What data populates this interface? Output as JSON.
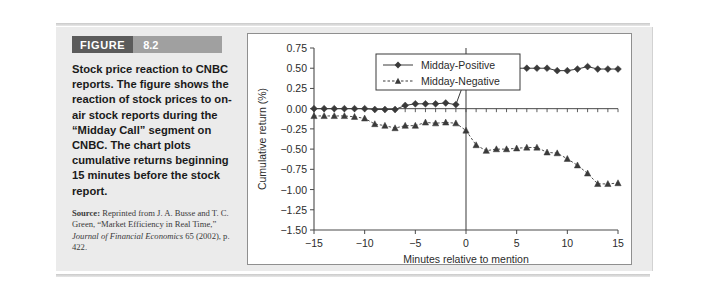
{
  "figure": {
    "label": "FIGURE",
    "number": "8.2",
    "caption": "Stock price reaction to CNBC reports. The figure shows the reaction of stock prices to on-air stock reports during the “Midday Call” segment on CNBC. The chart plots cumulative returns beginning 15 minutes before the stock report.",
    "source_prefix": "Source:",
    "source_text_1": " Reprinted from J. A. Busse and T. C. Green, “Market Efficiency in Real Time,” ",
    "source_italic_1": "Journal of Financial Economics",
    "source_text_2": " 65 (2002), p. 422."
  },
  "colors": {
    "figure_label_bg": "#5b5b5b",
    "figure_number_bg": "#a0a0a0",
    "panel_bg": "#ebebeb",
    "chart_bg": "#ffffff",
    "axis": "#4a4a4a",
    "series_positive": "#3a3a3a",
    "series_negative": "#3a3a3a"
  },
  "chart_data": {
    "type": "line",
    "title": "",
    "xlabel": "Minutes relative to mention",
    "ylabel": "Cumulative return (%)",
    "xlim": [
      -15,
      15
    ],
    "ylim": [
      -1.5,
      0.75
    ],
    "xticks": [
      -15,
      -10,
      -5,
      0,
      5,
      10,
      15
    ],
    "xticklabels": [
      "−15",
      "−10",
      "−5",
      "0",
      "5",
      "10",
      "15"
    ],
    "yticks": [
      0.75,
      0.5,
      0.25,
      0.0,
      -0.25,
      -0.5,
      -0.75,
      -1.0,
      -1.25,
      -1.5
    ],
    "yticklabels": [
      "0.75",
      "0.50",
      "0.25",
      "0.00",
      "−0.25",
      "−0.50",
      "−0.75",
      "−1.00",
      "−1.25",
      "−1.50"
    ],
    "grid": false,
    "legend_position": "top-center",
    "x": [
      -15,
      -14,
      -13,
      -12,
      -11,
      -10,
      -9,
      -8,
      -7,
      -6,
      -5,
      -4,
      -3,
      -2,
      -1,
      0,
      1,
      2,
      3,
      4,
      5,
      6,
      7,
      8,
      9,
      10,
      11,
      12,
      13,
      14,
      15
    ],
    "series": [
      {
        "name": "Midday-Positive",
        "marker": "diamond",
        "linestyle": "solid",
        "values": [
          0.0,
          0.0,
          0.0,
          0.0,
          0.0,
          0.0,
          -0.01,
          -0.01,
          -0.01,
          0.04,
          0.06,
          0.06,
          0.06,
          0.07,
          0.05,
          0.39,
          0.6,
          0.63,
          0.55,
          0.51,
          0.5,
          0.5,
          0.5,
          0.5,
          0.47,
          0.47,
          0.49,
          0.52,
          0.49,
          0.49,
          0.49
        ]
      },
      {
        "name": "Midday-Negative",
        "marker": "triangle",
        "linestyle": "dashed",
        "values": [
          -0.09,
          -0.09,
          -0.09,
          -0.09,
          -0.1,
          -0.12,
          -0.19,
          -0.21,
          -0.24,
          -0.21,
          -0.21,
          -0.17,
          -0.18,
          -0.17,
          -0.18,
          -0.27,
          -0.45,
          -0.52,
          -0.5,
          -0.5,
          -0.49,
          -0.48,
          -0.48,
          -0.54,
          -0.55,
          -0.62,
          -0.7,
          -0.8,
          -0.93,
          -0.93,
          -0.92
        ]
      }
    ],
    "annotations": [
      {
        "type": "vline",
        "x": 0,
        "label": "mention time"
      },
      {
        "type": "hline",
        "y": 0.0,
        "label": "zero return"
      }
    ]
  }
}
